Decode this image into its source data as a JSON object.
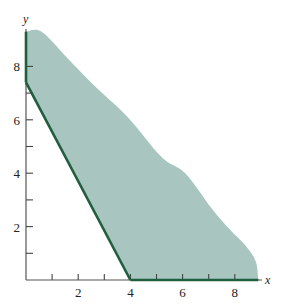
{
  "chart_data": {
    "type": "area",
    "title": "",
    "xlabel": "x",
    "ylabel": "y",
    "xlim": [
      0,
      9.2
    ],
    "ylim": [
      0,
      9.5
    ],
    "grid": false,
    "x_ticks": [
      1,
      2,
      3,
      4,
      5,
      6,
      7,
      8
    ],
    "x_tick_labels": [
      {
        "value": 2,
        "label": "2"
      },
      {
        "value": 4,
        "label": "4"
      },
      {
        "value": 6,
        "label": "6"
      },
      {
        "value": 8,
        "label": "8"
      }
    ],
    "y_ticks": [
      1,
      2,
      3,
      4,
      5,
      6,
      7,
      8
    ],
    "y_tick_labels": [
      {
        "value": 2,
        "label": "2"
      },
      {
        "value": 4,
        "label": "4"
      },
      {
        "value": 6,
        "label": "6"
      },
      {
        "value": 8,
        "label": "8"
      }
    ],
    "boundary_lines": [
      {
        "name": "y-axis segment",
        "points": [
          [
            0,
            9.3
          ],
          [
            0,
            7.4
          ]
        ]
      },
      {
        "name": "diagonal constraint",
        "points": [
          [
            0,
            7.4
          ],
          [
            4,
            0
          ]
        ]
      },
      {
        "name": "x-axis segment",
        "points": [
          [
            4,
            0
          ],
          [
            8.9,
            0
          ]
        ]
      }
    ],
    "shaded_region": {
      "description": "Feasible region bounded below-left by the line from (0,7.4) to (4,0), extending outward (unbounded) up and to the right",
      "outer_edge": [
        [
          0,
          9.3
        ],
        [
          0.6,
          9.3
        ],
        [
          1.6,
          8.3
        ],
        [
          2.7,
          7.2
        ],
        [
          3.9,
          6.1
        ],
        [
          5.2,
          4.6
        ],
        [
          6.1,
          4.0
        ],
        [
          7.1,
          2.7
        ],
        [
          7.8,
          1.9
        ],
        [
          8.4,
          1.3
        ],
        [
          8.8,
          0.7
        ],
        [
          8.9,
          0
        ]
      ],
      "fill_color": "#a9c5bf"
    },
    "line_color": "#1f5e3e"
  },
  "axes": {
    "x_label": "x",
    "y_label": "y"
  }
}
